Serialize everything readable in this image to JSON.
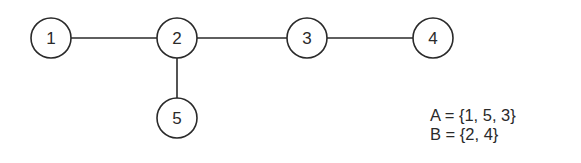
{
  "graph": {
    "nodes": [
      {
        "id": "1",
        "label": "1",
        "cx": 51,
        "cy": 38
      },
      {
        "id": "2",
        "label": "2",
        "cx": 177,
        "cy": 38
      },
      {
        "id": "3",
        "label": "3",
        "cx": 307,
        "cy": 38
      },
      {
        "id": "4",
        "label": "4",
        "cx": 433,
        "cy": 38
      },
      {
        "id": "5",
        "label": "5",
        "cx": 177,
        "cy": 118
      }
    ],
    "edges": [
      {
        "from": "1",
        "to": "2"
      },
      {
        "from": "2",
        "to": "3"
      },
      {
        "from": "3",
        "to": "4"
      },
      {
        "from": "2",
        "to": "5"
      }
    ],
    "node_radius": 20,
    "stroke_color": "#2a2a2a"
  },
  "sets": {
    "a": "A = {1, 5, 3}",
    "b": "B = {2, 4}"
  }
}
